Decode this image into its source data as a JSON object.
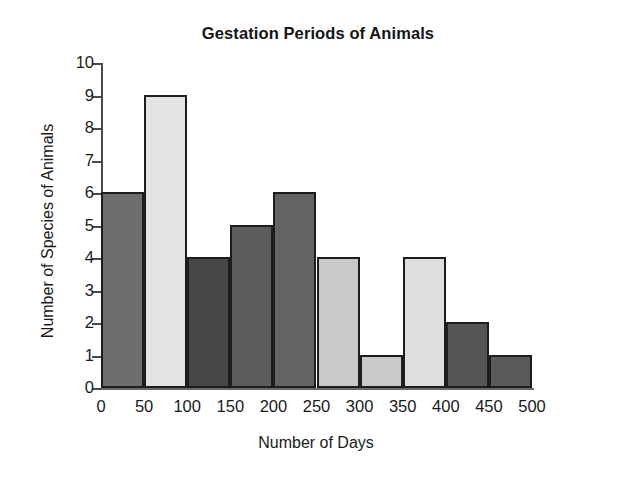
{
  "chart_data": {
    "type": "bar",
    "title": "Gestation Periods of Animals",
    "xlabel": "Number of Days",
    "ylabel": "Number of Species of Animals",
    "grid": false,
    "legend": "none",
    "bin_width": 50,
    "xlim": [
      0,
      500
    ],
    "ylim": [
      0,
      10
    ],
    "xticks": [
      "0",
      "50",
      "100",
      "150",
      "200",
      "250",
      "300",
      "350",
      "400",
      "450",
      "500"
    ],
    "xtick_values": [
      0,
      50,
      100,
      150,
      200,
      250,
      300,
      350,
      400,
      450,
      500
    ],
    "yticks": [
      "0",
      "1",
      "2",
      "3",
      "4",
      "5",
      "6",
      "7",
      "8",
      "9",
      "10"
    ],
    "ytick_values": [
      0,
      1,
      2,
      3,
      4,
      5,
      6,
      7,
      8,
      9,
      10
    ],
    "categories": [
      "0-50",
      "50-100",
      "100-150",
      "150-200",
      "200-250",
      "250-300",
      "300-350",
      "350-400",
      "400-450",
      "450-500"
    ],
    "values": [
      6,
      9,
      4,
      5,
      6,
      4,
      1,
      4,
      2,
      1
    ],
    "bars": [
      {
        "bin_start": 0,
        "bin_end": 50,
        "label": "0-50",
        "value": 6,
        "color": "#6e6e6e"
      },
      {
        "bin_start": 50,
        "bin_end": 100,
        "label": "50-100",
        "value": 9,
        "color": "#e4e4e4"
      },
      {
        "bin_start": 100,
        "bin_end": 150,
        "label": "100-150",
        "value": 4,
        "color": "#474747"
      },
      {
        "bin_start": 150,
        "bin_end": 200,
        "label": "150-200",
        "value": 5,
        "color": "#5c5c5c"
      },
      {
        "bin_start": 200,
        "bin_end": 250,
        "label": "200-250",
        "value": 6,
        "color": "#636363"
      },
      {
        "bin_start": 250,
        "bin_end": 300,
        "label": "250-300",
        "value": 4,
        "color": "#c9c9c9"
      },
      {
        "bin_start": 300,
        "bin_end": 350,
        "label": "300-350",
        "value": 1,
        "color": "#c9c9c9"
      },
      {
        "bin_start": 350,
        "bin_end": 400,
        "label": "350-400",
        "value": 4,
        "color": "#dedede"
      },
      {
        "bin_start": 400,
        "bin_end": 450,
        "label": "400-450",
        "value": 2,
        "color": "#555555"
      },
      {
        "bin_start": 450,
        "bin_end": 500,
        "label": "450-500",
        "value": 1,
        "color": "#5a5a5a"
      }
    ],
    "bar_edge_color": "#1d1d1d",
    "axis_color": "#4a4a4a",
    "background_color": "#ffffff",
    "text_color": "#1a1a1a"
  }
}
